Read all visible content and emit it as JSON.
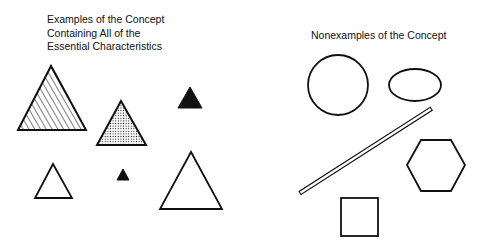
{
  "examples": {
    "heading_lines": [
      "Examples of the Concept",
      "Containing All of the",
      "Essential Characteristics"
    ],
    "shapes": [
      {
        "type": "triangle",
        "fill": "diagonal-hatch",
        "size": "large"
      },
      {
        "type": "triangle",
        "fill": "dotted",
        "size": "medium"
      },
      {
        "type": "triangle",
        "fill": "solid-black",
        "size": "small"
      },
      {
        "type": "triangle",
        "fill": "none",
        "size": "small"
      },
      {
        "type": "triangle",
        "fill": "solid-black",
        "size": "tiny"
      },
      {
        "type": "triangle",
        "fill": "none",
        "size": "large"
      }
    ]
  },
  "nonexamples": {
    "heading": "Nonexamples of the Concept",
    "shapes": [
      {
        "type": "circle",
        "fill": "none"
      },
      {
        "type": "ellipse",
        "fill": "none"
      },
      {
        "type": "line-bar",
        "fill": "none"
      },
      {
        "type": "hexagon",
        "fill": "none"
      },
      {
        "type": "square",
        "fill": "none"
      }
    ]
  },
  "colors": {
    "stroke": "#111111",
    "background": "#ffffff"
  }
}
